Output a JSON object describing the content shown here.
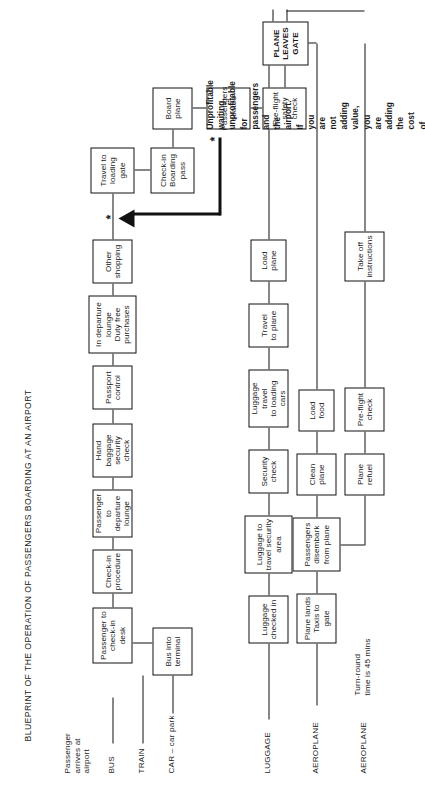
{
  "document": {
    "title": "BLUEPRINT OF THE OPERATION OF PASSENGERS BOARDING AT AN AIRPORT",
    "type": "service-blueprint-flowchart",
    "orientation": "rotated-90-ccw"
  },
  "swimlanes": [
    {
      "id": "passenger",
      "label": "Passenger\narrives at\nairport"
    },
    {
      "id": "bus",
      "label": "BUS"
    },
    {
      "id": "train",
      "label": "TRAIN"
    },
    {
      "id": "car",
      "label": "CAR – car park"
    },
    {
      "id": "luggage",
      "label": "LUGGAGE"
    },
    {
      "id": "aeroplane1",
      "label": "AEROPLANE"
    },
    {
      "id": "aeroplane2",
      "label": "AEROPLANE"
    }
  ],
  "annotations": {
    "turn_round": "Turn-round\ntime is 45 mins",
    "star_symbol": "*"
  },
  "note": {
    "marker": "*",
    "text": "Unprofitable waiting, unprofitable for passengers and the airport.\nIf you are not adding value, you are adding the cost of seats, space,\nlight, heat, aggravation, greater consideration of competitive forms\nof travel (train, ferry, Eurostar, etc.)"
  },
  "nodes": {
    "bus_into_terminal": "Bus into\nterminal",
    "passenger_to_checkin_desk": "Passenger to\ncheck-in desk",
    "checkin_procedure": "Check-in\nprocedure",
    "passenger_to_departure_lounge": "Passenger\nto departure\nlounge",
    "hand_baggage_security_check": "Hand baggage\nsecurity check",
    "passport_control": "Passport\ncontrol",
    "in_departure_lounge": "In departure\nlounge\nDuty free\npurchases",
    "other_shopping": "Other\nshopping",
    "travel_to_loading_gate": "Travel to\nloading\ngate",
    "checkin_boarding_pass": "Check-in\nBoarding\npass",
    "board_plane": "Board\nplane",
    "passengers_seated": "Passengers\nseated",
    "preflight_safety_check": "Pre-flight\nsafety\ncheck",
    "plane_leaves_gate": "PLANE\nLEAVES\nGATE",
    "luggage_checked_in": "Luggage\nchecked in",
    "luggage_to_travel_security_area": "Luggage to\ntravel security\narea",
    "security_check": "Security\ncheck",
    "luggage_travel_to_loading_cars": "Luggage travel\nto loading cars",
    "travel_to_plane": "Travel\nto plane",
    "load_plane": "Load plane",
    "plane_lands_taxis_to_gate": "Plane lands\nTaxis to gate",
    "passengers_disembark_from_plane": "Passengers\ndisembark\nfrom plane",
    "clean_plane": "Clean\nplane",
    "load_food": "Load food",
    "plane_refuel": "Plane\nrefuel",
    "preflight_check": "Pre-flight\ncheck",
    "take_off_instructions": "Take off\ninstructions"
  },
  "colors": {
    "ink": "#111111",
    "paper": "#ffffff"
  }
}
